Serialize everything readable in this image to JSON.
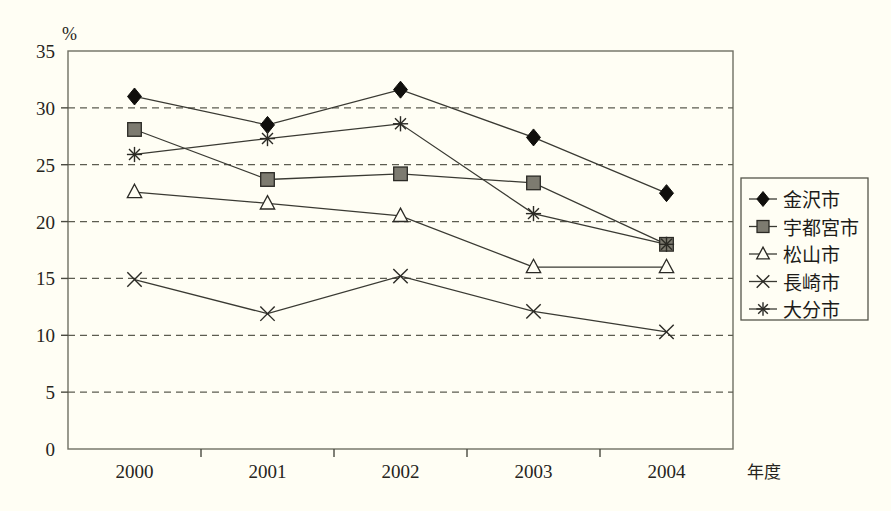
{
  "chart_data": {
    "type": "line",
    "title": "",
    "subtitle": "",
    "xlabel": "年度",
    "ylabel": "%",
    "ylim": [
      0,
      35
    ],
    "yticks": [
      0,
      5,
      10,
      15,
      20,
      25,
      30,
      35
    ],
    "ytick_labels": [
      "0",
      "5",
      "10",
      "15",
      "20",
      "25",
      "30",
      "35"
    ],
    "categories": [
      "2000",
      "2001",
      "2002",
      "2003",
      "2004"
    ],
    "grid": "horizontal-dashed",
    "legend_position": "right",
    "series": [
      {
        "name": "金沢市",
        "marker": "diamond-filled",
        "values": [
          31.0,
          28.5,
          31.6,
          27.4,
          22.5
        ]
      },
      {
        "name": "宇都宮市",
        "marker": "square-filled",
        "values": [
          28.1,
          23.7,
          24.2,
          23.4,
          18.0
        ]
      },
      {
        "name": "松山市",
        "marker": "triangle-open",
        "values": [
          22.6,
          21.6,
          20.5,
          16.0,
          16.0
        ]
      },
      {
        "name": "長崎市",
        "marker": "cross-x",
        "values": [
          14.9,
          11.9,
          15.2,
          12.1,
          10.3
        ]
      },
      {
        "name": "大分市",
        "marker": "asterisk",
        "values": [
          25.9,
          27.3,
          28.6,
          20.7,
          18.0
        ]
      }
    ]
  },
  "axes": {
    "y_unit_label": "%",
    "x_name_label": "年度"
  },
  "legend": {
    "entries": [
      {
        "label": "金沢市",
        "marker": "diamond-filled"
      },
      {
        "label": "宇都宮市",
        "marker": "square-filled"
      },
      {
        "label": "松山市",
        "marker": "triangle-open"
      },
      {
        "label": "長崎市",
        "marker": "cross-x"
      },
      {
        "label": "大分市",
        "marker": "asterisk"
      }
    ]
  },
  "colors": {
    "background": "#fffef4",
    "marker_fill_dark": "#100f0c",
    "marker_fill_gray": "#7d7b70",
    "line": "#3a3a33",
    "grid": "#5c5c50",
    "frame": "#6f6f63",
    "text": "#262420"
  }
}
